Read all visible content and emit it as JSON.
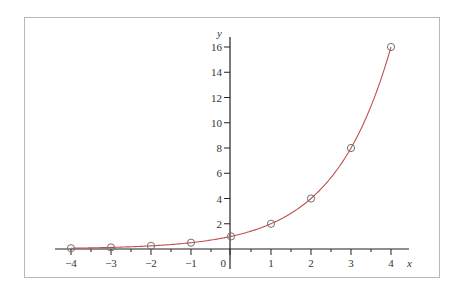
{
  "chart_data": {
    "type": "line",
    "title": "",
    "xlabel": "x",
    "ylabel": "y",
    "xlim": [
      -4,
      4
    ],
    "ylim": [
      0,
      16
    ],
    "grid": false,
    "legend": null,
    "x_ticks": [
      -4,
      -3,
      -2,
      -1,
      0,
      1,
      2,
      3,
      4
    ],
    "x_minor_ticks": [
      -3.5,
      -2.5,
      -1.5,
      -0.5,
      0.5,
      1.5,
      2.5,
      3.5
    ],
    "y_ticks": [
      2,
      4,
      6,
      8,
      10,
      12,
      14,
      16
    ],
    "series": [
      {
        "name": "y = 2^x (curve)",
        "kind": "line",
        "function": "2^x",
        "color": "#c0504d"
      },
      {
        "name": "data points",
        "kind": "scatter",
        "marker": "open-circle",
        "color": "#707070",
        "x": [
          -4,
          -3,
          -2,
          -1,
          0,
          1,
          2,
          3,
          4
        ],
        "y": [
          0.0625,
          0.125,
          0.25,
          0.5,
          1,
          2,
          4,
          8,
          16
        ]
      }
    ]
  }
}
